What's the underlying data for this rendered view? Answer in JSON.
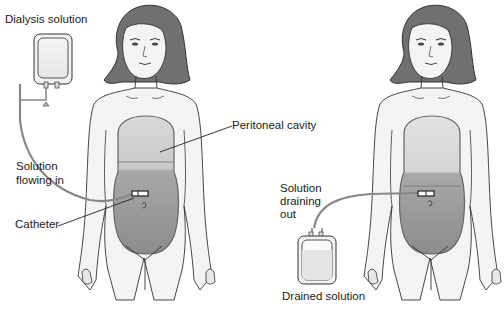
{
  "diagram": {
    "topic": "Peritoneal dialysis",
    "left_panel": {
      "labels": {
        "dialysis_solution": "Dialysis solution",
        "peritoneal_cavity": "Peritoneal cavity",
        "solution_flowing_in_line1": "Solution",
        "solution_flowing_in_line2": "flowing in",
        "catheter": "Catheter"
      }
    },
    "right_panel": {
      "labels": {
        "solution_draining_line1": "Solution",
        "solution_draining_line2": "draining",
        "solution_draining_line3": "out",
        "drained_solution": "Drained solution"
      }
    },
    "colors": {
      "hair": "#6e6e6e",
      "skin_outline": "#333333",
      "body_fill": "#f2f2f2",
      "cavity_fill_upper": "#c8c8c8",
      "cavity_fill_lower": "#8f8f8f",
      "tube": "#888888"
    }
  }
}
